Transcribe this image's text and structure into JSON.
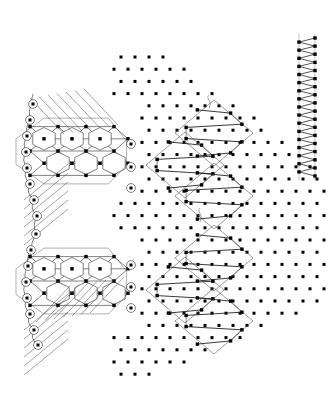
{
  "figure": {
    "title": "Multiscale lattice domain decomposition",
    "background_color": "#ffffff",
    "width": 329,
    "height": 397,
    "line_color": "#1a1a1a",
    "node_color": "#000000",
    "ring_color": "#2b2b2b",
    "outline_color": "#5a5a5a",
    "path_color": "#222222"
  },
  "regions": [
    {
      "name": "atomistic-region",
      "label": "hexagonal lattice blocks",
      "block_count": 2,
      "description": "triangular mesh with hexagonal voids"
    },
    {
      "name": "transition-region",
      "label": "rhombic cluster region",
      "cluster_count": 2,
      "rhombi_per_cluster": 3,
      "description": "dot lattice with rhombus outlines enclosing zigzag chains"
    },
    {
      "name": "continuum-region",
      "label": "zigzag column",
      "description": "dense vertical zigzag between two dot columns"
    }
  ],
  "chart_data": {
    "type": "scatter",
    "title": "Multiscale lattice domain decomposition",
    "xlabel": "",
    "ylabel": "",
    "xlim": [
      0,
      329
    ],
    "ylim": [
      0,
      397
    ],
    "grid": false,
    "legend": null,
    "lattice": {
      "type": "triangular",
      "dx": 14.0,
      "dy": 12.2,
      "row_offset": 7.0,
      "origin_x": 121.0,
      "origin_y": 57.0,
      "rows": 27,
      "wedge_apex_x": 150.0,
      "wedge_top_row": 0,
      "wedge_half_width_per_row": 0.52
    },
    "hex_blocks": [
      {
        "id": "block-top",
        "center_x": 72,
        "center_y": 151,
        "cols": 3,
        "rows": 2,
        "cell_w": 28.0,
        "cell_h": 24.4
      },
      {
        "id": "block-bottom",
        "center_x": 72,
        "center_y": 281,
        "cols": 3,
        "rows": 2,
        "cell_w": 28.0,
        "cell_h": 24.4
      }
    ],
    "boundary_rings_left": [
      {
        "x": 33,
        "y": 104
      },
      {
        "x": 30,
        "y": 120
      },
      {
        "x": 27,
        "y": 136
      },
      {
        "x": 26,
        "y": 152
      },
      {
        "x": 27,
        "y": 168
      },
      {
        "x": 30,
        "y": 184
      },
      {
        "x": 34,
        "y": 200
      },
      {
        "x": 37,
        "y": 216
      },
      {
        "x": 36,
        "y": 234
      },
      {
        "x": 31,
        "y": 250
      },
      {
        "x": 28,
        "y": 266
      },
      {
        "x": 26,
        "y": 282
      },
      {
        "x": 27,
        "y": 298
      },
      {
        "x": 30,
        "y": 314
      },
      {
        "x": 34,
        "y": 330
      },
      {
        "x": 38,
        "y": 345
      }
    ],
    "boundary_rings_right": [
      {
        "x": 131,
        "y": 144
      },
      {
        "x": 131,
        "y": 167
      },
      {
        "x": 131,
        "y": 188
      },
      {
        "x": 131,
        "y": 265
      },
      {
        "x": 131,
        "y": 287
      },
      {
        "x": 131,
        "y": 308
      }
    ],
    "rhombi": [
      {
        "cx": 214,
        "cy": 133,
        "hw": 39,
        "hh": 33,
        "cluster": "upper"
      },
      {
        "cx": 185,
        "cy": 165,
        "hw": 39,
        "hh": 33,
        "cluster": "upper"
      },
      {
        "cx": 214,
        "cy": 196,
        "hw": 39,
        "hh": 33,
        "cluster": "upper"
      },
      {
        "cx": 214,
        "cy": 258,
        "hw": 39,
        "hh": 33,
        "cluster": "lower"
      },
      {
        "cx": 185,
        "cy": 290,
        "hw": 39,
        "hh": 33,
        "cluster": "lower"
      },
      {
        "cx": 214,
        "cy": 321,
        "hw": 39,
        "hh": 33,
        "cluster": "lower"
      }
    ],
    "zigzag_column": {
      "x_left": 299,
      "x_right": 315,
      "y_top": 38,
      "y_bottom": 176,
      "teeth": 17
    },
    "connector_curves": [
      {
        "name": "upper-tail",
        "x": 209,
        "y_start": 95,
        "y_end": 108
      },
      {
        "name": "mid-tail",
        "x": 200,
        "y_start": 208,
        "y_end": 222
      }
    ]
  }
}
